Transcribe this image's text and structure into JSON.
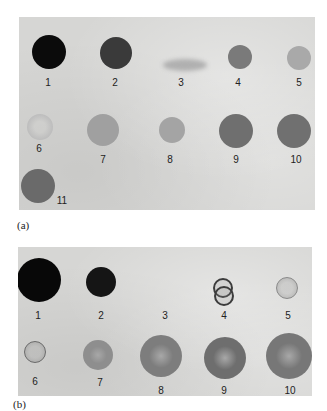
{
  "figure": {
    "panels": [
      {
        "id": "a",
        "caption": "(a)",
        "box": {
          "x": 19,
          "y": 17,
          "w": 296,
          "h": 193
        },
        "spots": [
          {
            "n": "1",
            "x": 49,
            "y": 52,
            "r": 17,
            "style": "solid",
            "color": "#0b0b0b",
            "lx": 48,
            "ly": 82
          },
          {
            "n": "2",
            "x": 116,
            "y": 53,
            "r": 16,
            "style": "solid",
            "color": "#3a3a3a",
            "lx": 115,
            "ly": 82
          },
          {
            "n": "3",
            "x": 185,
            "y": 65,
            "r": 0,
            "style": "streak",
            "color": "#b0b0b0",
            "lx": 181,
            "ly": 82
          },
          {
            "n": "4",
            "x": 240,
            "y": 57,
            "r": 12,
            "style": "solid",
            "color": "#7a7a7a",
            "lx": 238,
            "ly": 82
          },
          {
            "n": "5",
            "x": 299,
            "y": 58,
            "r": 12,
            "style": "solid",
            "color": "#a9a9a9",
            "lx": 299,
            "ly": 82
          },
          {
            "n": "6",
            "x": 40,
            "y": 127,
            "r": 13,
            "style": "faint",
            "color": "#bdbdbd",
            "lx": 39,
            "ly": 148
          },
          {
            "n": "7",
            "x": 103,
            "y": 130,
            "r": 16,
            "style": "solid",
            "color": "#a0a0a0",
            "lx": 103,
            "ly": 159
          },
          {
            "n": "8",
            "x": 172,
            "y": 130,
            "r": 13,
            "style": "solid",
            "color": "#a4a4a4",
            "lx": 170,
            "ly": 159
          },
          {
            "n": "9",
            "x": 236,
            "y": 131,
            "r": 17,
            "style": "solid",
            "color": "#6f6f6f",
            "lx": 236,
            "ly": 159
          },
          {
            "n": "10",
            "x": 294,
            "y": 131,
            "r": 17,
            "style": "solid",
            "color": "#707070",
            "lx": 296,
            "ly": 159
          },
          {
            "n": "11",
            "x": 38,
            "y": 186,
            "r": 17,
            "style": "solid",
            "color": "#6a6a6a",
            "lx": 62,
            "ly": 200
          }
        ]
      },
      {
        "id": "b",
        "caption": "(b)",
        "box": {
          "x": 18,
          "y": 247,
          "w": 294,
          "h": 149
        },
        "spots": [
          {
            "n": "1",
            "x": 39,
            "y": 280,
            "r": 22,
            "style": "solid",
            "color": "#080808",
            "lx": 38,
            "ly": 315
          },
          {
            "n": "2",
            "x": 101,
            "y": 282,
            "r": 15,
            "style": "solid",
            "color": "#151515",
            "lx": 101,
            "ly": 315
          },
          {
            "n": "3",
            "x": 165,
            "y": 290,
            "r": 0,
            "style": "none",
            "color": "#d6d6d4",
            "lx": 165,
            "ly": 315
          },
          {
            "n": "4",
            "x": 224,
            "y": 291,
            "r": 10,
            "style": "double-ring",
            "color": "#3c3c3c",
            "lx": 224,
            "ly": 315
          },
          {
            "n": "5",
            "x": 287,
            "y": 288,
            "r": 11,
            "style": "ring",
            "color": "#8a8a8a",
            "lx": 288,
            "ly": 315
          },
          {
            "n": "6",
            "x": 35,
            "y": 352,
            "r": 11,
            "style": "ring",
            "color": "#6a6a6a",
            "lx": 35,
            "ly": 381
          },
          {
            "n": "7",
            "x": 98,
            "y": 355,
            "r": 15,
            "style": "halo",
            "color": "#8e8e8e",
            "lx": 100,
            "ly": 382
          },
          {
            "n": "8",
            "x": 161,
            "y": 356,
            "r": 21,
            "style": "halo",
            "color": "#7d7d7d",
            "lx": 161,
            "ly": 390
          },
          {
            "n": "9",
            "x": 225,
            "y": 358,
            "r": 21,
            "style": "halo",
            "color": "#6e6e6e",
            "lx": 224,
            "ly": 390
          },
          {
            "n": "10",
            "x": 289,
            "y": 356,
            "r": 23,
            "style": "halo",
            "color": "#777777",
            "lx": 290,
            "ly": 390
          }
        ]
      }
    ],
    "captions": {
      "a": {
        "text": "(a)",
        "x": 17,
        "y": 219
      },
      "b": {
        "text": "(b)",
        "x": 13,
        "y": 398
      }
    }
  }
}
